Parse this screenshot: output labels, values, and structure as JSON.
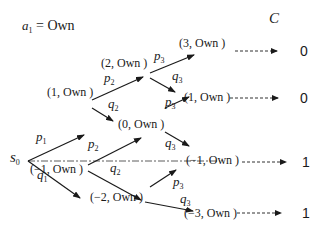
{
  "title": {
    "var": "a",
    "sub": "1",
    "eq": " = Own"
  },
  "cost_header": "C",
  "root": {
    "var": "s",
    "sub": "0"
  },
  "nodes": {
    "n1": "(1, Own )",
    "n2": "(2, Own )",
    "n3": "(3, Own )",
    "n0": "(0, Own )",
    "n1b": "(1, Own )",
    "nm1": "(−1, Own )",
    "nm1b": "(−1, Own )",
    "nm2": "(−2, Own )",
    "nm3": "(−3, Own )"
  },
  "edges": {
    "p1": {
      "var": "p",
      "sub": "1"
    },
    "q1": {
      "var": "q",
      "sub": "1"
    },
    "p2a": {
      "var": "p",
      "sub": "2"
    },
    "q2a": {
      "var": "q",
      "sub": "2"
    },
    "p2b": {
      "var": "p",
      "sub": "2"
    },
    "q2b": {
      "var": "q",
      "sub": "2"
    },
    "p3a": {
      "var": "p",
      "sub": "3"
    },
    "q3a": {
      "var": "q",
      "sub": "3"
    },
    "p3b": {
      "var": "p",
      "sub": "3"
    },
    "q3b": {
      "var": "q",
      "sub": "3"
    },
    "p3c": {
      "var": "p",
      "sub": "3"
    },
    "q3c": {
      "var": "q",
      "sub": "3"
    }
  },
  "costs": [
    "0",
    "0",
    "1",
    "1"
  ],
  "colors": {
    "ink": "#1a1a1a",
    "background": "#ffffff"
  }
}
